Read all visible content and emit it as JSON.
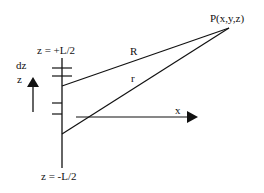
{
  "diagram": {
    "labels": {
      "top_end": "z = +L/2",
      "bottom_end": "z = -L/2",
      "element": "dz",
      "z_axis": "z",
      "x_axis": "x",
      "distance_R": "R",
      "distance_r": "r",
      "point": "P(x,y,z)"
    },
    "colors": {
      "stroke": "#111111",
      "background": "#ffffff"
    }
  }
}
